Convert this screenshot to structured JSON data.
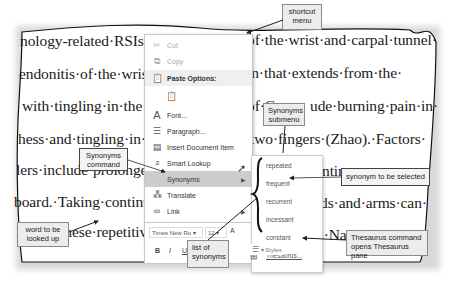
{
  "document": {
    "lines": [
      "nology-related·RSIs·ir",
      "endonitis·of·the·wrist·ir",
      "with·tingling·in·the·fir",
      "hess·and·tingling·in·the",
      "lers·include·prolonged·",
      "board.·Taking·continual",
      "loping·these·repetitiv"
    ],
    "right_lines": [
      "of·the·wrist·and·carpal·tunnel·",
      "in·that·extends·from·the·",
      "of·Co",
      "ude·burning·pain·in·",
      "two·fingers·(Zhao).·Factors·",
      "ntim",
      "ds·and·arms·can·",
      "d·Nadeer)"
    ],
    "partial_word_breaks": "breaks·and·exce"
  },
  "context_menu": {
    "items": [
      {
        "label": "Cut",
        "icon": "scissors-icon",
        "disabled": true
      },
      {
        "label": "Copy",
        "icon": "copy-icon",
        "disabled": true
      },
      {
        "label": "Paste Options:",
        "icon": "paste-icon",
        "header": true
      },
      {
        "label": "",
        "icon": "paste-keep-text-icon"
      },
      {
        "label": "Font...",
        "icon": "font-icon"
      },
      {
        "label": "Paragraph...",
        "icon": "paragraph-icon"
      },
      {
        "label": "Insert Document Item",
        "icon": "insert-document-icon"
      },
      {
        "label": "Smart Lookup",
        "icon": "search-icon"
      },
      {
        "label": "Synonyms",
        "icon": "",
        "highlighted": true,
        "submenu": true
      },
      {
        "label": "Translate",
        "icon": "translate-icon"
      },
      {
        "label": "Link",
        "icon": "link-icon",
        "submenu": true
      },
      {
        "label": "New Comment",
        "icon": "comment-icon",
        "disabled": true
      }
    ]
  },
  "mini_toolbar": {
    "font_name": "Times New Ro",
    "font_size": "12",
    "grow_font": "A",
    "shrink_font": "A",
    "bold": "B",
    "italic": "I",
    "underline": "U",
    "styles_label": "Styles"
  },
  "synonyms_submenu": {
    "items": [
      "repeated",
      "frequent",
      "recurrent",
      "incessant",
      "constant"
    ],
    "thesaurus_label": "Thesaurus..."
  },
  "callouts": {
    "shortcut_menu": "shortcut menu",
    "synonyms_submenu": "Synonyms submenu",
    "synonyms_command": "Synonyms command",
    "synonym_selected": "synonym to be selected",
    "word_looked_up": "word to be looked up",
    "list_of_synonyms": "list of synonyms",
    "thesaurus_command": "Thesaurus command opens Thesaurus pane"
  }
}
